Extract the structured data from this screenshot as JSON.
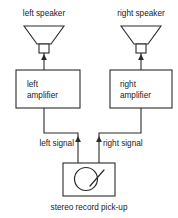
{
  "diagram": {
    "colors": {
      "background": "#ffffff",
      "stroke": "#2b2b2b",
      "text": "#1a1a1a"
    },
    "speakers": [
      {
        "label": "left speaker",
        "side": "left"
      },
      {
        "label": "right speaker",
        "side": "right"
      }
    ],
    "amplifiers": [
      {
        "line1": "left",
        "line2": "amplifier",
        "side": "left"
      },
      {
        "line1": "right",
        "line2": "amplifier",
        "side": "right"
      }
    ],
    "signals": [
      {
        "label": "left signal",
        "side": "left"
      },
      {
        "label": "right signal",
        "side": "right"
      }
    ],
    "source": {
      "caption": "stereo record pick-up",
      "icon": "record-disc-with-tonearm"
    }
  }
}
